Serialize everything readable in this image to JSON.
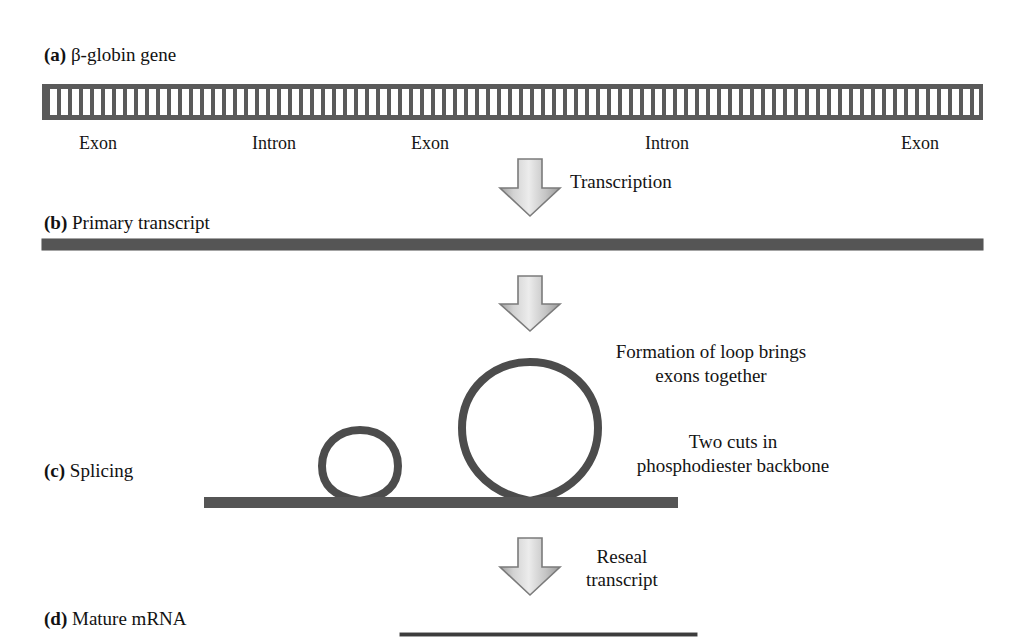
{
  "figure": {
    "panels": [
      {
        "tag": "(a)",
        "label": "β-globin gene"
      },
      {
        "tag": "(b)",
        "label": "Primary transcript"
      },
      {
        "tag": "(c)",
        "label": "Splicing"
      },
      {
        "tag": "(d)",
        "label": "Mature mRNA"
      }
    ],
    "gene_segments": [
      {
        "name": "Exon",
        "center_x": 98
      },
      {
        "name": "Intron",
        "center_x": 274
      },
      {
        "name": "Exon",
        "center_x": 430
      },
      {
        "name": "Intron",
        "center_x": 667
      },
      {
        "name": "Exon",
        "center_x": 920
      }
    ],
    "steps": [
      {
        "name": "transcription",
        "label": "Transcription"
      },
      {
        "name": "reseal",
        "label_line1": "Reseal",
        "label_line2": "transcript"
      }
    ],
    "annotations": [
      {
        "name": "loop-formation",
        "line1": "Formation of loop brings",
        "line2": "exons together"
      },
      {
        "name": "backbone-cuts",
        "line1": "Two cuts in",
        "line2": "phosphodiester backbone"
      }
    ],
    "colors": {
      "strand": "#555555",
      "ladder": "#5a5a5a",
      "loop_stroke": "#4c4c4c",
      "arrow_outline": "#6e6e6e",
      "arrow_fill_light": "#e9e9e9",
      "arrow_fill_dark": "#a8a8a8",
      "text": "#141414",
      "background": "#ffffff"
    }
  }
}
